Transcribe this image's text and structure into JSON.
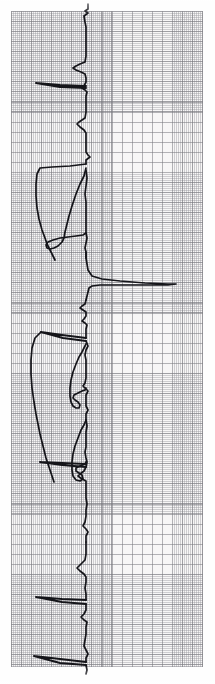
{
  "document": {
    "kind": "ecg-rhythm-strip",
    "title": "",
    "orientation": "rotated-90-time-axis-vertical"
  },
  "paper": {
    "name": "ecg-graph-paper",
    "background_color": "#f7f6f6",
    "minor_grid_color": "#96969c",
    "minor_grid_spacing_px": 2,
    "major_grid_color": "#78787e",
    "major_grid_spacing_px": 10,
    "left_px": 11,
    "top_px": 11,
    "width_px": 192,
    "height_px": 656
  },
  "trace": {
    "name": "ecg-waveform",
    "color": "#15151a",
    "stroke_width_px": 1.7,
    "baseline_x_px": 86,
    "description": "Single-lead ECG tracing running top to bottom; baseline near x=86 with QRS complexes deflecting left and right.",
    "segments": [
      {
        "name": "upper-beat-group",
        "d": "M 88 4 L 88 9 L 85 11 L 88 13 L 84 16 L 85 22 L 86 27 L 86 36 L 86 46 L 86 56 L 85 62 L 80 64 L 76 66 L 73 68 L 76 70 L 81 72 L 85 74 L 86 78 L 86 82 L 84 86 L 82 88 L 85 90 L 87 92 L 86 96 L 86 104 L 86 112 L 85 118 L 82 120 L 79 122 L 77 124 L 80 127 L 84 130 L 86 133 L 86 140 L 86 147 L 86 152 L 88 155 L 90 157 L 86 160 L 86 164"
      },
      {
        "name": "calibration-bar-1",
        "d": "M 86 86 L 60 85 L 36 83 M 36 83 L 60 87 L 86 88"
      },
      {
        "name": "wide-complex-1",
        "d": "M 86 164 L 70 166 L 52 167 L 40 168 L 37 174 L 36 184 L 36 196 L 37 208 L 39 219 L 42 230 L 45 238 L 47 244 L 50 250 L 53 256 L 55 260"
      },
      {
        "name": "inner-loop-1",
        "d": "M 86 168 L 84 176 L 80 184 L 76 194 L 72 206 L 69 216 L 67 224 L 65 232 L 64 238 L 62 242 L 58 246 L 54 248 L 50 249 L 47 248 L 46 245 L 48 242 L 53 240 L 60 238 L 68 237 L 76 236 L 83 235 L 86 233"
      },
      {
        "name": "inner-spike-cluster-1",
        "d": "M 86 170 L 87 178 L 86 186 L 85 194 L 86 202 L 86 210 L 86 218 L 86 226 L 86 233 L 87 238 L 86 243 L 85 248 L 86 252 L 86 258"
      },
      {
        "name": "tall-r-spike",
        "d": "M 86 252 L 86 258 L 87 264 L 88 270 L 92 276 L 102 279 L 120 281 L 145 283 L 168 284 L 176 284 L 168 285 L 145 285 L 120 285 L 100 285 L 92 286 L 89 288 L 88 292 L 87 296 L 86 300"
      },
      {
        "name": "post-spike-oscillation",
        "d": "M 86 300 L 85 304 L 82 306 L 80 308 L 83 310 L 86 312 L 86 316 L 84 319 L 82 321 L 85 323 L 87 325 L 86 329 L 86 334 L 86 338"
      },
      {
        "name": "calibration-bar-2",
        "d": "M 86 338 L 62 335 L 41 332 M 41 332 L 63 338 L 86 341"
      },
      {
        "name": "wide-complex-2",
        "d": "M 41 332 L 35 338 L 32 348 L 31 360 L 31 374 L 32 388 L 34 402 L 36 414 L 38 424 L 40 434 L 42 442 L 44 450 L 46 458 L 48 464 L 50 470 L 52 476 L 54 482"
      },
      {
        "name": "inner-loop-2",
        "d": "M 86 344 L 84 348 L 82 352 L 79 357 L 76 364 L 73 372 L 71 380 L 70 388 L 70 396 L 71 402 L 73 406 L 76 408 L 79 408 L 80 405 L 78 402 L 75 400 L 73 398 L 74 395 L 78 393 L 82 391 L 85 390 L 86 388"
      },
      {
        "name": "mid-beat-spikes",
        "d": "M 86 341 L 88 346 L 86 350 L 85 355 L 86 360 L 86 366 L 86 372 L 86 378 L 85 383 L 83 386 L 86 389 L 88 391 L 86 395 L 86 400 L 86 406 L 88 410 L 86 414 L 86 420"
      },
      {
        "name": "inner-loop-3",
        "d": "M 86 420 L 84 425 L 81 430 L 78 438 L 75 446 L 73 454 L 72 462 L 72 470 L 73 476 L 76 480 L 80 481 L 83 479 L 82 475 L 79 473 L 76 471 L 76 468 L 80 466 L 85 464 L 86 462"
      },
      {
        "name": "calibration-bar-3",
        "d": "M 86 464 L 62 463 L 40 462 M 40 462 L 62 465 L 86 467"
      },
      {
        "name": "lower-beat-group",
        "d": "M 86 420 L 87 426 L 86 432 L 86 440 L 86 447 L 85 452 L 86 458 L 87 462 L 86 467 L 84 471 L 80 474 L 78 476 L 82 479 L 86 481 L 86 486 L 86 492 L 86 498 L 87 504 L 86 510 L 86 516 L 85 522 L 83 526 L 86 529 L 88 532 L 86 536 L 86 542"
      },
      {
        "name": "lower-beat-group-2",
        "d": "M 86 542 L 86 548 L 86 554 L 85 560 L 82 563 L 79 566 L 77 568 L 80 571 L 84 574 L 86 577 L 86 582 L 85 588 L 86 594 L 86 600"
      },
      {
        "name": "calibration-bar-4",
        "d": "M 86 600 L 62 599 L 36 597 M 36 597 L 62 602 L 86 604"
      },
      {
        "name": "terminal-beat",
        "d": "M 86 604 L 86 610 L 84 614 L 81 617 L 84 620 L 87 622 L 86 627 L 86 634 L 85 640 L 84 646 L 86 650 L 88 654 L 86 658 L 86 662"
      },
      {
        "name": "calibration-bar-5",
        "d": "M 86 662 L 60 659 L 34 656 M 34 656 L 60 663 L 86 665"
      },
      {
        "name": "baseline-tail",
        "d": "M 86 665 L 87 670 L 86 674"
      }
    ]
  }
}
